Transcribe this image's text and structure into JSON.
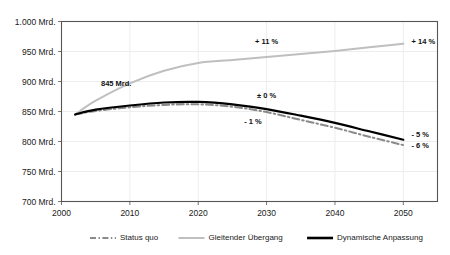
{
  "chart_data": {
    "type": "line",
    "title": "",
    "subtitle": "",
    "xlabel": "",
    "ylabel": "",
    "xlim": [
      2000,
      2055
    ],
    "ylim": [
      700,
      1000
    ],
    "grid": true,
    "legend_position": "bottom",
    "x_ticks": [
      "2000",
      "2010",
      "2020",
      "2030",
      "2040",
      "2050"
    ],
    "x_tick_values": [
      2000,
      2010,
      2020,
      2030,
      2040,
      2050
    ],
    "y_ticks": [
      "700 Mrd.",
      "750 Mrd.",
      "800 Mrd.",
      "850 Mrd.",
      "900 Mrd.",
      "950 Mrd.",
      "1.000 Mrd."
    ],
    "y_tick_values": [
      700,
      750,
      800,
      850,
      900,
      950,
      1000
    ],
    "x": [
      2002,
      2005,
      2010,
      2015,
      2020,
      2025,
      2030,
      2035,
      2040,
      2045,
      2050
    ],
    "series": [
      {
        "name": "Status quo",
        "color": "#8a8a8a",
        "style": "dash-dot",
        "width": 2.0,
        "values": [
          845,
          851,
          857,
          861,
          862,
          858,
          849,
          836,
          823,
          808,
          794
        ]
      },
      {
        "name": "Gleitender Übergang",
        "color": "#bfbfbf",
        "style": "solid",
        "width": 2.0,
        "values": [
          845,
          868,
          897,
          918,
          931,
          936,
          941,
          946,
          951,
          957,
          963
        ]
      },
      {
        "name": "Dynamische Anpassung",
        "color": "#000000",
        "style": "solid",
        "width": 2.2,
        "values": [
          845,
          853,
          860,
          865,
          866,
          862,
          854,
          843,
          831,
          817,
          803
        ]
      }
    ],
    "annotations": [
      {
        "id": "start-value",
        "text": "845 Mrd.",
        "x": 2008,
        "y": 893,
        "bold": true
      },
      {
        "id": "gleitend-mid",
        "text": "+ 11 %",
        "x": 2030,
        "y": 962,
        "bold": true
      },
      {
        "id": "gleitend-end",
        "text": "+ 14 %",
        "x": 2053,
        "y": 963,
        "bold": true
      },
      {
        "id": "dynamisch-mid",
        "text": "± 0 %",
        "x": 2030,
        "y": 872,
        "bold": true
      },
      {
        "id": "status-mid",
        "text": "- 1 %",
        "x": 2028,
        "y": 829,
        "bold": true
      },
      {
        "id": "dynamisch-end",
        "text": "- 5 %",
        "x": 2053,
        "y": 808,
        "bold": true
      },
      {
        "id": "status-end",
        "text": "- 6 %",
        "x": 2053,
        "y": 790,
        "bold": true
      }
    ]
  },
  "legend": {
    "items": [
      {
        "label": "Status quo"
      },
      {
        "label": "Gleitender Übergang"
      },
      {
        "label": "Dynamische Anpassung"
      }
    ]
  }
}
